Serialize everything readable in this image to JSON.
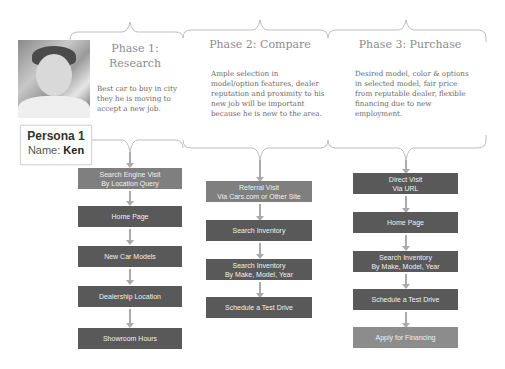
{
  "persona": {
    "title": "Persona 1",
    "name_label": "Name:",
    "name": "Ken",
    "photo": "persona-photo"
  },
  "phases": [
    {
      "title_line1": "Phase 1:",
      "title_line2": "Research",
      "description": "Best car to buy in city they he is moving to accept a new job.",
      "steps": [
        {
          "label1": "Search Engine Visit",
          "label2": "By Location Query",
          "color": "#7f7f7f"
        },
        {
          "label1": "Home Page",
          "label2": "",
          "color": "#595959"
        },
        {
          "label1": "New Car Models",
          "label2": "",
          "color": "#595959"
        },
        {
          "label1": "Dealership Location",
          "label2": "",
          "color": "#595959"
        },
        {
          "label1": "Showroom Hours",
          "label2": "",
          "color": "#595959"
        }
      ]
    },
    {
      "title_line1": "Phase 2: Compare",
      "description": "Ample selection in model/option features, dealer reputation and proximity to his new job will be important because he is new to the area.",
      "steps": [
        {
          "label1": "Referral Visit",
          "label2": "Via Cars.com or Other Site",
          "color": "#7f7f7f"
        },
        {
          "label1": "Search Inventory",
          "label2": "",
          "color": "#595959"
        },
        {
          "label1": "Search Inventory",
          "label2": "By Make, Model, Year",
          "color": "#595959"
        },
        {
          "label1": "Schedule a Test Drive",
          "label2": "",
          "color": "#595959"
        }
      ]
    },
    {
      "title_line1": "Phase 3: Purchase",
      "description": "Desired model, color & options in selected model, fair price from reputable dealer, flexible financing due to new employment.",
      "steps": [
        {
          "label1": "Direct Visit",
          "label2": "Via URL",
          "color": "#595959"
        },
        {
          "label1": "Home Page",
          "label2": "",
          "color": "#595959"
        },
        {
          "label1": "Search Inventory",
          "label2": "By Make, Model, Year",
          "color": "#595959"
        },
        {
          "label1": "Schedule a Test Drive",
          "label2": "",
          "color": "#595959"
        },
        {
          "label1": "Apply for Financing",
          "label2": "",
          "color": "#8c8c8c"
        }
      ]
    }
  ]
}
